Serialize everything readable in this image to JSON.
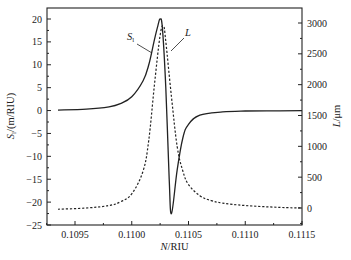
{
  "chart_data": {
    "type": "line",
    "title": "",
    "xlabel": "N/RIU",
    "ylabel_left": "S_l/(m/RIU)",
    "ylabel_right": "L/μm",
    "xlim": [
      0.1093,
      0.1115
    ],
    "ylim_left": [
      -25,
      22
    ],
    "ylim_right": [
      -250,
      3200
    ],
    "x_ticks": [
      "0.1095",
      "0.1100",
      "0.1105",
      "0.1110",
      "0.1115"
    ],
    "x_tick_values": [
      0.1095,
      0.11,
      0.1105,
      0.111,
      0.1115
    ],
    "y_left_ticks": [
      "20",
      "15",
      "10",
      "5",
      "0",
      "-5",
      "-10",
      "-15",
      "-20",
      "-25"
    ],
    "y_left_tick_values": [
      20,
      15,
      10,
      5,
      0,
      -5,
      -10,
      -15,
      -20,
      -25
    ],
    "y_right_ticks": [
      "3000",
      "2500",
      "2000",
      "1500",
      "1000",
      "500",
      "0"
    ],
    "y_right_tick_values": [
      3000,
      2500,
      2000,
      1500,
      1000,
      500,
      0
    ],
    "grid": false,
    "legend": "inline annotations",
    "annotations": [
      {
        "text": "S_l",
        "series": "S_l",
        "position": "left of peak"
      },
      {
        "text": "L",
        "series": "L",
        "position": "right of peak"
      }
    ],
    "series": [
      {
        "name": "S_l",
        "axis": "left",
        "style": "solid",
        "x": [
          0.10935,
          0.1096,
          0.1098,
          0.1099,
          0.11,
          0.1101,
          0.11015,
          0.1102,
          0.11023,
          0.11025,
          0.11027,
          0.1103,
          0.11033,
          0.11035,
          0.1104,
          0.11045,
          0.1105,
          0.1106,
          0.1108,
          0.111,
          0.1113,
          0.1115
        ],
        "values": [
          0.1,
          0.3,
          0.8,
          1.5,
          3.0,
          6.5,
          10.0,
          15.5,
          18.5,
          20.0,
          18.0,
          5.0,
          -15.0,
          -22.5,
          -13.0,
          -6.0,
          -3.0,
          -1.0,
          -0.3,
          -0.1,
          -0.05,
          0.0
        ]
      },
      {
        "name": "L",
        "axis": "right",
        "style": "dashed",
        "x": [
          0.10935,
          0.1096,
          0.1098,
          0.1099,
          0.11,
          0.1101,
          0.11015,
          0.1102,
          0.11025,
          0.11028,
          0.1103,
          0.11035,
          0.1104,
          0.11045,
          0.1105,
          0.1106,
          0.1107,
          0.1108,
          0.111,
          0.1113,
          0.1115
        ],
        "values": [
          -20,
          0,
          40,
          100,
          230,
          600,
          1100,
          2000,
          2800,
          2950,
          2700,
          1800,
          1000,
          600,
          380,
          200,
          120,
          80,
          40,
          10,
          0
        ]
      }
    ]
  }
}
